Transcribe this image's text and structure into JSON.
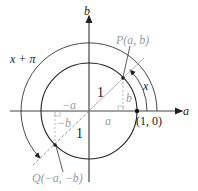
{
  "diagram": {
    "axes": {
      "x_label": "a",
      "y_label": "b"
    },
    "point_P": "P(a, b)",
    "point_Q": "Q(−a, −b)",
    "point_unit": "(1, 0)",
    "arc_x": "x",
    "arc_x_pi": "x + π",
    "radius_P": "1",
    "radius_Q": "1",
    "leg_a": "a",
    "leg_b": "b",
    "leg_neg_a": "−a",
    "leg_neg_b": "−b",
    "colors": {
      "line": "#222222",
      "annotation": "#9a9a9a"
    }
  }
}
